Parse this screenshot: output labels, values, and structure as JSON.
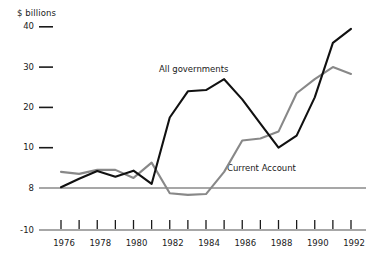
{
  "figure": {
    "unit_label": "$ billions",
    "background_color": "#ffffff"
  },
  "chart_data": {
    "type": "line",
    "title": "",
    "subtitle": "",
    "xlabel": "",
    "ylabel": "$ billions",
    "ylim": [
      -10,
      42
    ],
    "xlim": [
      1975.5,
      1992.5
    ],
    "grid": false,
    "legend_position": "inline-annotations",
    "zero_line": 0,
    "ytick_labels": [
      "40",
      "30",
      "20",
      "10",
      "8",
      "-10"
    ],
    "ytick_values": [
      40,
      30,
      20,
      10,
      0,
      -10
    ],
    "xtick_values": [
      1976,
      1977,
      1978,
      1979,
      1980,
      1981,
      1982,
      1983,
      1984,
      1985,
      1986,
      1987,
      1988,
      1989,
      1990,
      1991,
      1992
    ],
    "xtick_labels": [
      "1976",
      "",
      "1978",
      "",
      "1980",
      "",
      "1982",
      "",
      "1984",
      "",
      "1986",
      "",
      "1988",
      "",
      "1990",
      "",
      "1992"
    ],
    "xtick_labels_shown": [
      "1976",
      "1978",
      "1980",
      "1982",
      "1984",
      "1986",
      "1988",
      "1990",
      "1992"
    ],
    "x": [
      1976,
      1977,
      1978,
      1979,
      1980,
      1981,
      1982,
      1983,
      1984,
      1985,
      1986,
      1987,
      1988,
      1989,
      1990,
      1991,
      1992
    ],
    "series": [
      {
        "name": "All governments",
        "color": "#111111",
        "line_width": 2.1,
        "annotation": "All governments",
        "values": [
          0.2,
          2.3,
          4.2,
          2.8,
          4.3,
          1.0,
          17.5,
          24.0,
          24.3,
          27.0,
          22.0,
          16.0,
          10.0,
          13.0,
          22.5,
          36.0,
          39.5
        ]
      },
      {
        "name": "Current Account",
        "color": "#888888",
        "line_width": 2.1,
        "annotation": "Current Account",
        "values": [
          4.0,
          3.5,
          4.5,
          4.5,
          2.5,
          6.3,
          -1.3,
          -1.7,
          -1.5,
          4.0,
          11.8,
          12.3,
          14.0,
          23.5,
          27.0,
          30.0,
          28.3
        ]
      }
    ]
  }
}
